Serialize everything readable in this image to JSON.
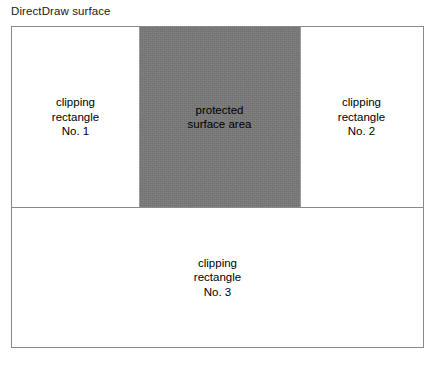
{
  "figure": {
    "title": "DirectDraw surface",
    "colors": {
      "page_background": "#ffffff",
      "surface_background": "#ffffff",
      "surface_border": "#8a8a8a",
      "protected_area_fill": "#787879",
      "divider": "#8a8a8a",
      "text": "#000000"
    }
  },
  "surface": {
    "top_band": {
      "regions": [
        {
          "name": "clipping-rectangle-1",
          "label": "clipping\nrectangle\nNo. 1",
          "line1": "clipping",
          "line2": "rectangle",
          "line3": "No. 1",
          "fill": "#ffffff"
        },
        {
          "name": "protected-surface-area",
          "label": "protected\nsurface area",
          "line1": "protected",
          "line2": "surface area",
          "fill": "#787879"
        },
        {
          "name": "clipping-rectangle-2",
          "label": "clipping\nrectangle\nNo. 2",
          "line1": "clipping",
          "line2": "rectangle",
          "line3": "No. 2",
          "fill": "#ffffff"
        }
      ]
    },
    "bottom_band": {
      "region": {
        "name": "clipping-rectangle-3",
        "label": "clipping\nrectangle\nNo. 3",
        "line1": "clipping",
        "line2": "rectangle",
        "line3": "No. 3",
        "fill": "#ffffff"
      }
    }
  }
}
